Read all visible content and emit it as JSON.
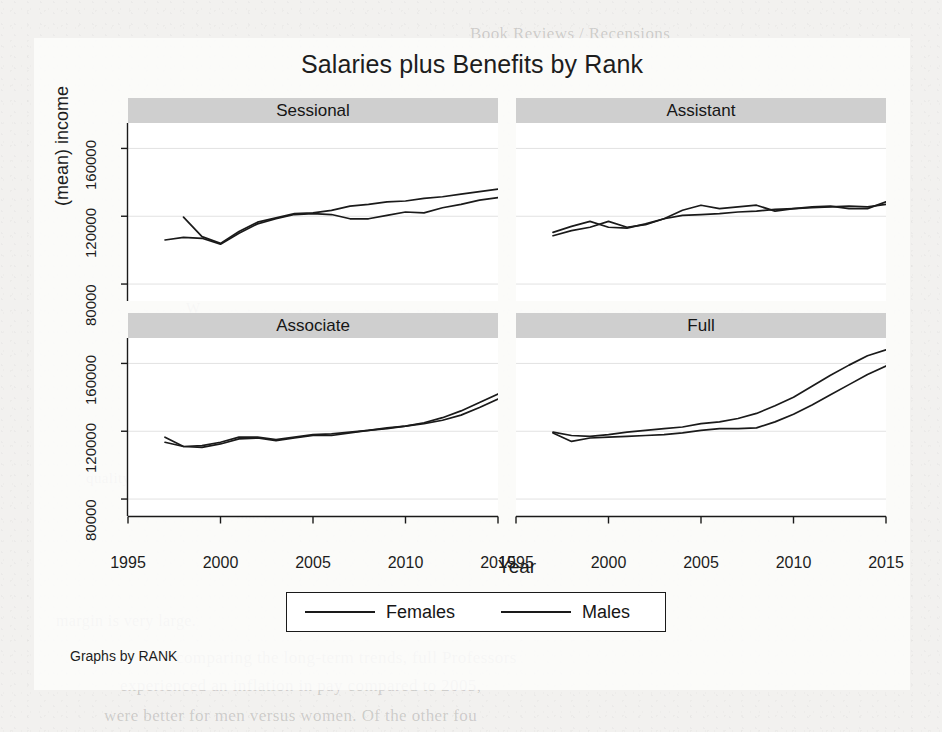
{
  "figure": {
    "title": "Salaries plus Benefits by Rank",
    "y_axis_title": "(mean) income",
    "x_axis_title": "Year",
    "note": "Graphs by RANK",
    "ink_color": "#1a1a1a",
    "strip_color": "#cfcfcf",
    "panel_color": "#ffffff"
  },
  "legend": {
    "entries": [
      {
        "label": "Females"
      },
      {
        "label": "Males"
      }
    ]
  },
  "axes": {
    "y_ticks": [
      "80000",
      "120000",
      "160000"
    ],
    "x_ticks": [
      "1995",
      "2000",
      "2005",
      "2010",
      "2015"
    ]
  },
  "background_bleed": [
    {
      "text": "Book Reviews / Recensions",
      "x": 470,
      "y": 24,
      "size": 17
    },
    {
      "text": "the same",
      "x": 700,
      "y": 196,
      "size": 15
    },
    {
      "text": "and the",
      "x": 392,
      "y": 232,
      "size": 15
    },
    {
      "text": "W",
      "x": 186,
      "y": 300,
      "size": 15
    },
    {
      "text": "of the",
      "x": 318,
      "y": 268,
      "size": 15
    },
    {
      "text": "quality of work",
      "x": 86,
      "y": 470,
      "size": 15
    },
    {
      "text": "that a",
      "x": 236,
      "y": 506,
      "size": 15
    },
    {
      "text": "a comparable",
      "x": 590,
      "y": 468,
      "size": 15
    },
    {
      "text": "margin is very large.",
      "x": 56,
      "y": 612,
      "size": 16
    },
    {
      "text": "comparing the long-term trends, full Professors",
      "x": 176,
      "y": 648,
      "size": 17
    },
    {
      "text": "experienced an inflation in pay compared to 2005,",
      "x": 120,
      "y": 676,
      "size": 17
    },
    {
      "text": "were better for men versus women. Of the other fou",
      "x": 104,
      "y": 706,
      "size": 17
    }
  ],
  "chart_data": {
    "type": "line",
    "title": "Salaries plus Benefits by Rank",
    "xlabel": "Year",
    "ylabel": "(mean) income",
    "xlim": [
      1995,
      2015
    ],
    "ylim": [
      70000,
      175000
    ],
    "grid": true,
    "grid_y": [
      80000,
      120000,
      160000
    ],
    "legend_position": "bottom",
    "facet_by": "RANK",
    "panels": [
      {
        "name": "Sessional",
        "x": [
          1997,
          1998,
          1999,
          2000,
          2001,
          2002,
          2003,
          2004,
          2005,
          2006,
          2007,
          2008,
          2009,
          2010,
          2011,
          2012,
          2013,
          2014,
          2015
        ],
        "series": [
          {
            "name": "Females",
            "values": [
              106000,
              107500,
              107000,
              103500,
              110000,
              115500,
              118500,
              121000,
              121500,
              121000,
              118500,
              118500,
              120500,
              122500,
              122000,
              125000,
              127000,
              129500,
              131000
            ]
          },
          {
            "name": "Males",
            "values": [
              null,
              119500,
              108000,
              104000,
              111000,
              116500,
              119000,
              121500,
              122000,
              123500,
              126000,
              127000,
              128500,
              129000,
              130500,
              131500,
              133000,
              134500,
              136000
            ]
          }
        ]
      },
      {
        "name": "Assistant",
        "x": [
          1997,
          1998,
          1999,
          2000,
          2001,
          2002,
          2003,
          2004,
          2005,
          2006,
          2007,
          2008,
          2009,
          2010,
          2011,
          2012,
          2013,
          2014,
          2015
        ],
        "series": [
          {
            "name": "Females",
            "values": [
              110500,
              114000,
              117000,
              113500,
              113000,
              115500,
              118500,
              123500,
              126500,
              124500,
              125500,
              126500,
              123000,
              124500,
              125500,
              126000,
              124500,
              124500,
              128500
            ]
          },
          {
            "name": "Males",
            "values": [
              108500,
              111500,
              113500,
              117000,
              113500,
              115000,
              118500,
              120500,
              121000,
              121500,
              122500,
              123000,
              124000,
              124500,
              125000,
              125500,
              126000,
              125500,
              127000
            ]
          }
        ]
      },
      {
        "name": "Associate",
        "x": [
          1997,
          1998,
          1999,
          2000,
          2001,
          2002,
          2003,
          2004,
          2005,
          2006,
          2007,
          2008,
          2009,
          2010,
          2011,
          2012,
          2013,
          2014,
          2015
        ],
        "series": [
          {
            "name": "Females",
            "values": [
              116500,
              111000,
              110500,
              112500,
              115500,
              116000,
              114500,
              116000,
              117500,
              117500,
              119000,
              120500,
              121500,
              123000,
              125000,
              128000,
              132000,
              137000,
              142000
            ]
          },
          {
            "name": "Males",
            "values": [
              113500,
              111000,
              111500,
              113500,
              116500,
              116500,
              115000,
              116500,
              118000,
              118500,
              119500,
              120500,
              122000,
              123000,
              124500,
              126500,
              129500,
              134000,
              139000
            ]
          }
        ]
      },
      {
        "name": "Full",
        "x": [
          1997,
          1998,
          1999,
          2000,
          2001,
          2002,
          2003,
          2004,
          2005,
          2006,
          2007,
          2008,
          2009,
          2010,
          2011,
          2012,
          2013,
          2014,
          2015
        ],
        "series": [
          {
            "name": "Females",
            "values": [
              119500,
              117500,
              117000,
              118000,
              119500,
              120500,
              121500,
              122500,
              124500,
              125500,
              127500,
              130500,
              135000,
              140000,
              146500,
              153000,
              159000,
              164500,
              168000
            ]
          },
          {
            "name": "Males",
            "values": [
              119000,
              114000,
              116000,
              116500,
              117000,
              117500,
              118000,
              119000,
              120500,
              121500,
              121500,
              122000,
              125500,
              130000,
              135500,
              141500,
              147500,
              153500,
              158500
            ]
          }
        ]
      }
    ]
  }
}
